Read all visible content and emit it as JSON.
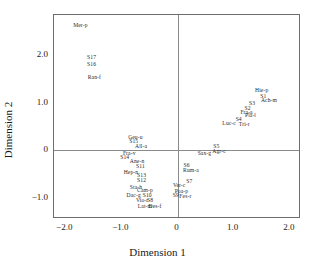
{
  "chart_data": {
    "type": "scatter",
    "title": "",
    "xlabel": "Dimension 1",
    "ylabel": "Dimension 2",
    "xlim": [
      -2.2,
      2.2
    ],
    "ylim": [
      -1.45,
      2.85
    ],
    "xticks": [
      "−2.0",
      "−1.0",
      "0",
      "1.0",
      "2.0"
    ],
    "xtick_values": [
      -2.0,
      -1.0,
      0,
      1.0,
      2.0
    ],
    "yticks": [
      "2.0",
      "1.0",
      "0",
      "−1.0"
    ],
    "ytick_values": [
      2.0,
      1.0,
      0,
      -1.0
    ],
    "grid": false,
    "legend": null,
    "marker": "label-only",
    "points": [
      {
        "label": "Mer-p",
        "x": -1.73,
        "y": 2.62
      },
      {
        "label": "S17",
        "x": -1.53,
        "y": 1.94
      },
      {
        "label": "S16",
        "x": -1.53,
        "y": 1.79
      },
      {
        "label": "Ran-f",
        "x": -1.48,
        "y": 1.53
      },
      {
        "label": "Hie-p",
        "x": 1.5,
        "y": 1.25
      },
      {
        "label": "S1",
        "x": 1.53,
        "y": 1.13
      },
      {
        "label": "Ach-m",
        "x": 1.63,
        "y": 1.03
      },
      {
        "label": "S3",
        "x": 1.33,
        "y": 0.97
      },
      {
        "label": "S2",
        "x": 1.25,
        "y": 0.87
      },
      {
        "label": "Fra-a",
        "x": 1.23,
        "y": 0.78
      },
      {
        "label": "Pla-l",
        "x": 1.3,
        "y": 0.73
      },
      {
        "label": "S4",
        "x": 1.09,
        "y": 0.63
      },
      {
        "label": "Tri-r",
        "x": 1.19,
        "y": 0.53
      },
      {
        "label": "Luc-c",
        "x": 0.92,
        "y": 0.55
      },
      {
        "label": "Geu-u",
        "x": -0.75,
        "y": 0.26
      },
      {
        "label": "S15",
        "x": -0.78,
        "y": 0.17
      },
      {
        "label": "All-a",
        "x": -0.65,
        "y": 0.06
      },
      {
        "label": "S5",
        "x": 0.69,
        "y": 0.07
      },
      {
        "label": "Agr-c",
        "x": 0.74,
        "y": -0.04
      },
      {
        "label": "Sax-g",
        "x": 0.48,
        "y": -0.09
      },
      {
        "label": "Fra-v",
        "x": -0.86,
        "y": -0.09
      },
      {
        "label": "S14",
        "x": -0.94,
        "y": -0.17
      },
      {
        "label": "Ane-n",
        "x": -0.72,
        "y": -0.25
      },
      {
        "label": "S11",
        "x": -0.66,
        "y": -0.36
      },
      {
        "label": "S6",
        "x": 0.16,
        "y": -0.33
      },
      {
        "label": "Rum-a",
        "x": 0.24,
        "y": -0.43
      },
      {
        "label": "Hep-n",
        "x": -0.83,
        "y": -0.47
      },
      {
        "label": "S13",
        "x": -0.64,
        "y": -0.55
      },
      {
        "label": "S12",
        "x": -0.64,
        "y": -0.64
      },
      {
        "label": "S7",
        "x": 0.21,
        "y": -0.66
      },
      {
        "label": "Ver-c",
        "x": 0.03,
        "y": -0.76
      },
      {
        "label": "Sta-h",
        "x": -0.74,
        "y": -0.8
      },
      {
        "label": "Cam-p",
        "x": -0.58,
        "y": -0.85
      },
      {
        "label": "Poa-p",
        "x": 0.07,
        "y": -0.88
      },
      {
        "label": "Dac-g",
        "x": -0.78,
        "y": -0.96
      },
      {
        "label": "S10",
        "x": -0.54,
        "y": -0.97
      },
      {
        "label": "S9",
        "x": -0.03,
        "y": -0.97
      },
      {
        "label": "Fes-r",
        "x": 0.14,
        "y": -0.98
      },
      {
        "label": "Vio-r",
        "x": -0.63,
        "y": -1.07
      },
      {
        "label": "S8",
        "x": -0.49,
        "y": -1.08
      },
      {
        "label": "Lat-m",
        "x": -0.58,
        "y": -1.19
      },
      {
        "label": "Des-f",
        "x": -0.4,
        "y": -1.2
      }
    ]
  }
}
